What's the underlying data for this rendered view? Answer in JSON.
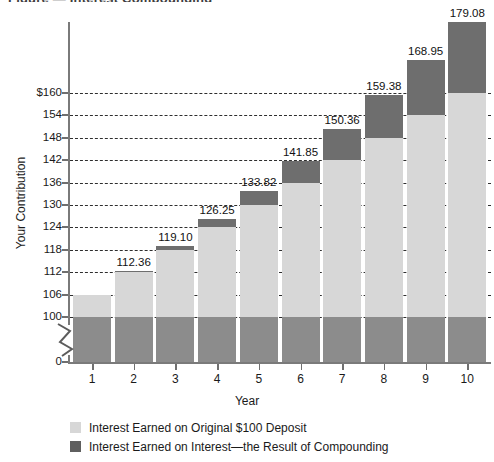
{
  "title_fragment": "Figure — Interest Compounding",
  "chart_data": {
    "type": "bar",
    "subtype": "stacked-bar",
    "title": "",
    "xlabel": "Year",
    "ylabel": "Your Contribution",
    "categories": [
      "1",
      "2",
      "3",
      "4",
      "5",
      "6",
      "7",
      "8",
      "9",
      "10"
    ],
    "x_tick_labels": [
      "1",
      "2",
      "3",
      "4",
      "5",
      "6",
      "7",
      "8",
      "9",
      "10"
    ],
    "y_tick_labels": [
      "$160",
      "154",
      "148",
      "142",
      "136",
      "130",
      "124",
      "118",
      "112",
      "106",
      "100",
      "0"
    ],
    "y_tick_values": [
      160,
      154,
      148,
      142,
      136,
      130,
      124,
      118,
      112,
      106,
      100,
      0
    ],
    "ylim": [
      100,
      160
    ],
    "axis_break": true,
    "axis_break_note": "y-axis broken between 0 and 100",
    "grid": true,
    "grid_style": "dashed-horizontal",
    "legend_position": "below",
    "series": [
      {
        "name": "Interest Earned on Original $100 Deposit",
        "color": "#d7d7d7",
        "values": [
          106.0,
          112.0,
          118.0,
          124.0,
          130.0,
          136.0,
          142.0,
          148.0,
          154.0,
          160.0
        ]
      },
      {
        "name": "Interest Earned on Interest—the Result of Compounding",
        "color": "#6e6e6e",
        "values": [
          0.0,
          0.36,
          1.1,
          2.25,
          3.82,
          5.85,
          8.36,
          11.38,
          14.95,
          19.08
        ]
      }
    ],
    "totals": [
      106.0,
      112.36,
      119.1,
      126.25,
      133.82,
      141.85,
      150.36,
      159.38,
      168.95,
      179.08
    ],
    "data_labels": [
      "",
      "112.36",
      "119.10",
      "126.25",
      "133.82",
      "141.85",
      "150.36",
      "159.38",
      "168.95",
      "179.08"
    ],
    "base_value": 100,
    "base_color": "#8c8c8c"
  },
  "legend": {
    "items": [
      {
        "label": "Interest Earned on Original $100 Deposit",
        "swatch": "light"
      },
      {
        "label": "Interest Earned on Interest—the Result of Compounding",
        "swatch": "dark"
      }
    ]
  },
  "axes": {
    "y_title": "Your Contribution",
    "x_title": "Year"
  }
}
